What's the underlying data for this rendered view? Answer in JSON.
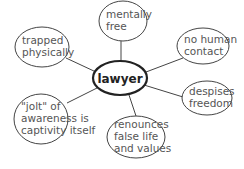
{
  "diagram": {
    "type": "mind-map",
    "center": {
      "label": "lawyer",
      "cx": 120,
      "cy": 78,
      "rx": 27,
      "ry": 17
    },
    "nodes": [
      {
        "id": "mentally-free",
        "lines": [
          "mentally",
          "free"
        ],
        "cx": 123,
        "cy": 21,
        "rx": 24,
        "ry": 20,
        "link": [
          121,
          41,
          121,
          61
        ]
      },
      {
        "id": "trapped-physically",
        "lines": [
          "trapped",
          "physically"
        ],
        "cx": 42,
        "cy": 47,
        "rx": 27,
        "ry": 20,
        "link": [
          66,
          58,
          96,
          72
        ]
      },
      {
        "id": "no-human-contact",
        "lines": [
          "no human",
          "contact"
        ],
        "cx": 203,
        "cy": 46,
        "rx": 26,
        "ry": 18,
        "link": [
          183,
          58,
          146,
          72
        ]
      },
      {
        "id": "despises-freedom",
        "lines": [
          "despises",
          "freedom"
        ],
        "cx": 207,
        "cy": 98,
        "rx": 25,
        "ry": 17,
        "link": [
          183,
          97,
          144,
          85
        ]
      },
      {
        "id": "jolt-of-awareness",
        "lines": [
          "\"jolt\" of",
          "awareness is",
          "captivity itself"
        ],
        "cx": 41,
        "cy": 119,
        "rx": 27,
        "ry": 25,
        "link": [
          67,
          103,
          97,
          88
        ]
      },
      {
        "id": "renounces-false-life",
        "lines": [
          "renounces",
          "false life",
          "and values"
        ],
        "cx": 136,
        "cy": 137,
        "rx": 29,
        "ry": 21,
        "link": [
          136,
          116,
          129,
          95
        ]
      }
    ]
  },
  "colors": {
    "background": "#ffffff",
    "stroke": "#444444",
    "center_stroke": "#222222",
    "text": "#555555",
    "center_text": "#222222"
  }
}
